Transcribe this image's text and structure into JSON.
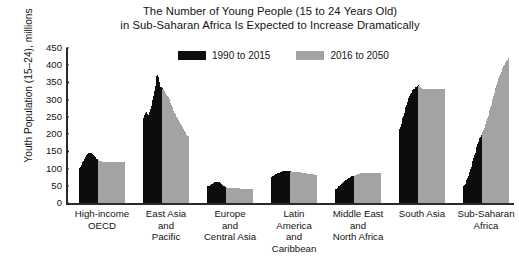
{
  "chart_data": {
    "type": "bar",
    "title": "The Number of Young People (15 to 24 Years Old) in Sub-Saharan Africa Is Expected to Increase Dramatically",
    "title_line1": "The Number of Young People (15 to 24 Years Old)",
    "title_line2": "in Sub-Saharan Africa Is Expected to Increase Dramatically",
    "xlabel": "",
    "ylabel": "Youth Population (15–24), millions",
    "ylim": [
      0,
      450
    ],
    "yticks": [
      0,
      50,
      100,
      150,
      200,
      250,
      300,
      350,
      400,
      450
    ],
    "ytick_labels": [
      "0",
      "50",
      "100",
      "150",
      "200",
      "250",
      "300",
      "350",
      "400",
      "450"
    ],
    "grid": false,
    "legend_position": "top-center",
    "legend": [
      {
        "name": "1990 to 2015",
        "color": "#0d0d0d"
      },
      {
        "name": "2016 to 2050",
        "color": "#a3a3a3"
      }
    ],
    "series": [
      {
        "name": "1990 to 2015",
        "color": "#0d0d0d"
      },
      {
        "name": "2016 to 2050",
        "color": "#a3a3a3"
      }
    ],
    "categories": [
      "High-income OECD",
      "East Asia and Pacific",
      "Europe and Central Asia",
      "Latin America and Caribbean",
      "Middle East and North Africa",
      "South Asia",
      "Sub-Saharan Africa"
    ],
    "groups": [
      {
        "label_lines": [
          "High-income",
          "OECD"
        ],
        "historical": [
          100,
          103,
          106,
          110,
          114,
          118,
          122,
          127,
          131,
          135,
          139,
          142,
          144,
          146,
          146,
          145,
          144,
          142,
          140,
          138,
          136,
          133,
          131,
          129,
          127,
          125
        ],
        "projected": [
          124,
          123,
          122,
          121,
          121,
          120,
          120,
          120,
          120,
          120,
          120,
          120,
          120,
          120,
          120,
          120,
          120,
          120,
          120,
          120,
          120,
          120,
          120,
          120,
          119,
          119,
          118,
          118,
          118,
          118,
          118,
          118,
          118,
          118,
          118
        ]
      },
      {
        "label_lines": [
          "East Asia",
          "and",
          "Pacific"
        ],
        "historical": [
          240,
          248,
          256,
          262,
          264,
          262,
          258,
          256,
          258,
          264,
          272,
          282,
          292,
          300,
          312,
          324,
          340,
          356,
          368,
          372,
          366,
          352,
          340,
          336,
          336,
          334
        ],
        "projected": [
          332,
          330,
          326,
          320,
          316,
          314,
          312,
          308,
          302,
          296,
          290,
          284,
          278,
          272,
          266,
          262,
          258,
          254,
          250,
          246,
          242,
          238,
          234,
          230,
          226,
          222,
          218,
          214,
          210,
          206,
          202,
          198,
          196,
          194,
          192
        ]
      },
      {
        "label_lines": [
          "Europe",
          "and",
          "Central Asia"
        ],
        "historical": [
          47,
          48,
          49,
          50,
          51,
          52,
          54,
          55,
          57,
          58,
          60,
          61,
          62,
          62,
          62,
          61,
          60,
          58,
          56,
          54,
          52,
          50,
          49,
          48,
          47,
          46
        ],
        "projected": [
          46,
          45,
          45,
          44,
          44,
          43,
          43,
          43,
          43,
          43,
          43,
          43,
          43,
          43,
          43,
          43,
          43,
          42,
          42,
          42,
          41,
          41,
          41,
          40,
          40,
          40,
          40,
          40,
          40,
          40,
          40,
          40,
          40,
          40,
          40
        ]
      },
      {
        "label_lines": [
          "Latin",
          "America",
          "and",
          "Caribbean"
        ],
        "historical": [
          74,
          76,
          78,
          79,
          81,
          82,
          83,
          84,
          85,
          86,
          87,
          88,
          89,
          90,
          91,
          92,
          92,
          93,
          93,
          93,
          93,
          93,
          93,
          92,
          92,
          92
        ],
        "projected": [
          91,
          91,
          91,
          91,
          90,
          90,
          90,
          90,
          90,
          90,
          89,
          89,
          89,
          88,
          88,
          88,
          87,
          87,
          87,
          86,
          86,
          86,
          85,
          85,
          85,
          84,
          84,
          84,
          83,
          83,
          83,
          82,
          82,
          82,
          82
        ]
      },
      {
        "label_lines": [
          "Middle East",
          "and",
          "North Africa"
        ],
        "historical": [
          38,
          40,
          42,
          44,
          46,
          48,
          50,
          52,
          54,
          56,
          58,
          60,
          62,
          64,
          66,
          68,
          70,
          72,
          73,
          74,
          75,
          76,
          77,
          77,
          78,
          78
        ],
        "projected": [
          79,
          80,
          81,
          82,
          83,
          84,
          85,
          86,
          86,
          87,
          87,
          87,
          88,
          88,
          88,
          88,
          88,
          88,
          88,
          88,
          88,
          88,
          88,
          88,
          88,
          88,
          88,
          88,
          88,
          88,
          88,
          88,
          88,
          88,
          88
        ]
      },
      {
        "label_lines": [
          "South Asia"
        ],
        "historical": [
          206,
          214,
          222,
          230,
          238,
          246,
          254,
          262,
          270,
          278,
          286,
          292,
          298,
          304,
          310,
          316,
          320,
          324,
          328,
          330,
          332,
          334,
          336,
          338,
          340,
          342
        ],
        "projected": [
          340,
          338,
          336,
          334,
          332,
          332,
          332,
          332,
          332,
          332,
          332,
          332,
          332,
          332,
          332,
          332,
          332,
          332,
          331,
          331,
          330,
          330,
          330,
          330,
          330,
          330,
          330,
          330,
          330,
          330,
          330,
          330,
          330,
          330,
          330
        ]
      },
      {
        "label_lines": [
          "Sub-Saharan",
          "Africa"
        ],
        "historical": [
          44,
          48,
          52,
          56,
          60,
          66,
          72,
          78,
          84,
          90,
          98,
          106,
          114,
          122,
          130,
          138,
          146,
          154,
          162,
          170,
          176,
          182,
          188,
          193,
          197,
          201
        ],
        "projected": [
          206,
          212,
          218,
          224,
          230,
          238,
          246,
          254,
          262,
          270,
          278,
          286,
          294,
          302,
          310,
          318,
          326,
          334,
          342,
          350,
          356,
          362,
          368,
          374,
          380,
          386,
          392,
          397,
          402,
          406,
          410,
          413,
          416,
          418,
          420
        ]
      }
    ]
  }
}
